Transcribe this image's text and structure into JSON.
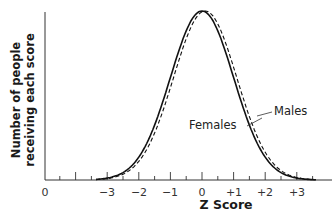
{
  "chart_data": {
    "type": "line",
    "title": "",
    "xlabel": "Z Score",
    "ylabel": "Number of people receiving each score",
    "ylabel_lines": [
      "Number of people",
      "receiving each score"
    ],
    "x_tick_labels": [
      "0",
      "−3",
      "−2",
      "−1",
      "0",
      "+1",
      "+2",
      "+3"
    ],
    "x_ticks": [
      -3,
      -2,
      -1,
      0,
      1,
      2,
      3
    ],
    "xlim": [
      -3.5,
      3.5
    ],
    "grid": false,
    "legend_position": "annotations on curves (right side)",
    "series": [
      {
        "name": "Females",
        "style": "solid",
        "mean": 0.0,
        "sd": 1.0,
        "x": [
          -3,
          -2,
          -1,
          0,
          1,
          2,
          3
        ],
        "values": [
          0.011,
          0.135,
          0.607,
          1.0,
          0.607,
          0.135,
          0.011
        ]
      },
      {
        "name": "Males",
        "style": "dashed",
        "mean": 0.1,
        "sd": 1.0,
        "x": [
          -3,
          -2,
          -1,
          0,
          1,
          2,
          3
        ],
        "values": [
          0.009,
          0.11,
          0.546,
          0.995,
          0.667,
          0.164,
          0.015
        ]
      }
    ],
    "annotations": [
      "Females",
      "Males"
    ]
  },
  "axis": {
    "x_label": "Z Score",
    "y_label_line1": "Number of people",
    "y_label_line2": "receiving each score",
    "origin_label": "0",
    "tick_labels": [
      "−3",
      "−2",
      "−1",
      "0",
      "+1",
      "+2",
      "+3"
    ]
  },
  "legend": {
    "females": "Females",
    "males": "Males"
  },
  "colors": {
    "line": "#111111",
    "axis": "#333333"
  }
}
